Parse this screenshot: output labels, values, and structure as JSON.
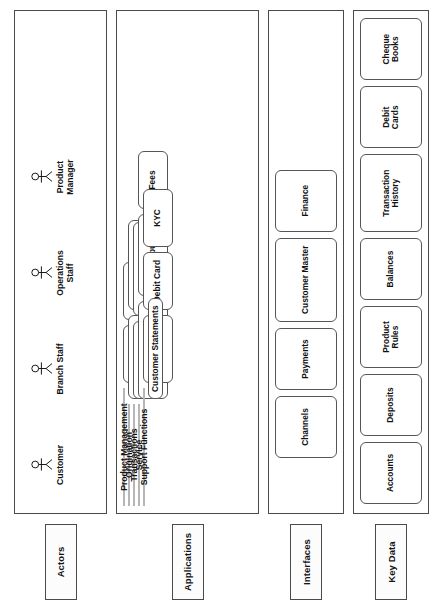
{
  "diagram": {
    "orientation": "rotated-90-ccw",
    "colors": {
      "group_header_fill": "#dddddd",
      "box_border": "#555555",
      "lane_border": "#4a4a4a",
      "background": "#ffffff",
      "text": "#111111"
    }
  },
  "lanes": [
    {
      "id": "actors",
      "label": "Actors"
    },
    {
      "id": "applications",
      "label": "Applications"
    },
    {
      "id": "interfaces",
      "label": "Interfaces"
    },
    {
      "id": "key_data",
      "label": "Key Data"
    }
  ],
  "actors": {
    "lane_label": "Actors",
    "items": [
      {
        "label": "Customer",
        "icon": "actor-stick-figure-icon"
      },
      {
        "label": "Branch Staff",
        "icon": "actor-stick-figure-icon"
      },
      {
        "label": "Operations Staff",
        "icon": "actor-stick-figure-icon"
      },
      {
        "label": "Product Manager",
        "icon": "actor-stick-figure-icon"
      }
    ]
  },
  "applications": {
    "lane_label": "Applications",
    "groups": [
      {
        "label": "Product Management",
        "items": [
          "Accounts",
          "Deposits"
        ],
        "extra_items": []
      },
      {
        "label": "Origination",
        "items": [
          "Account Opening",
          "Account Activation"
        ],
        "extra_items": []
      },
      {
        "label": "Transactions",
        "items": [
          "Balance Checks",
          "Transaction Posting"
        ],
        "extra_items": []
      },
      {
        "label": "Service",
        "items": [
          "Interest Computation",
          "Tax Computation",
          "Fees"
        ],
        "extra_items": []
      },
      {
        "label": "Support Functions",
        "items": [
          "Cheque Book",
          "Debit Card",
          "KYC"
        ],
        "extra_items": [
          "Customer Statements"
        ]
      }
    ]
  },
  "interfaces": {
    "lane_label": "Interfaces",
    "items": [
      "Channels",
      "Payments",
      "Customer Master",
      "Finance"
    ]
  },
  "key_data": {
    "lane_label": "Key Data",
    "items": [
      "Accounts",
      "Deposits",
      "Product Rules",
      "Balances",
      "Transaction History",
      "Debit Cards",
      "Cheque Books"
    ]
  }
}
